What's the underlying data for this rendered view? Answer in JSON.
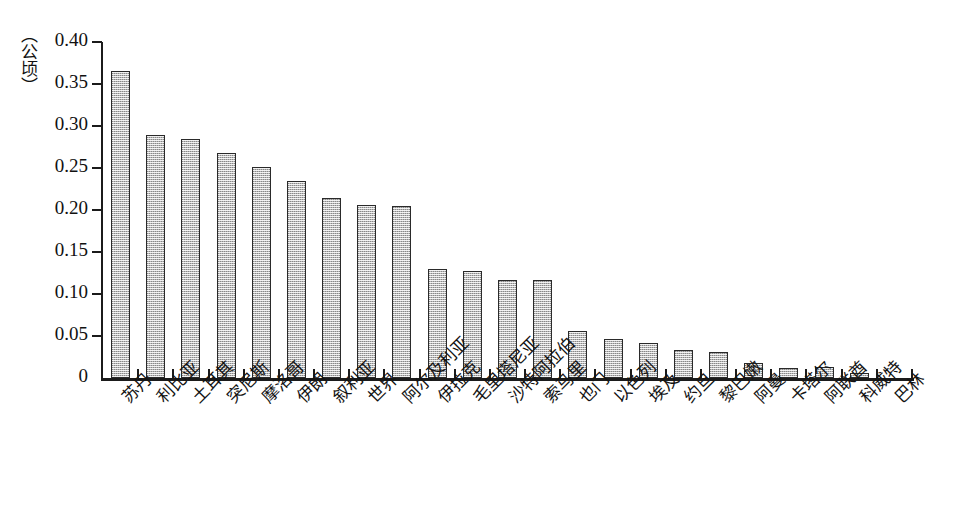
{
  "chart_data": {
    "type": "bar",
    "title": "",
    "subtitle": "",
    "xlabel": "",
    "ylabel": "（公顷）",
    "ylim": [
      0,
      0.4
    ],
    "ytick_labels": [
      "0.40",
      "0.35",
      "0.30",
      "0.25",
      "0.20",
      "0.15",
      "0.10",
      "0.05",
      "0"
    ],
    "ytick_values": [
      0.4,
      0.35,
      0.3,
      0.25,
      0.2,
      0.15,
      0.1,
      0.05,
      0
    ],
    "grid": false,
    "legend": null,
    "legend_position": "none",
    "categories": [
      "苏丹",
      "利比亚",
      "土耳其",
      "突尼斯",
      "摩洛哥",
      "伊朗",
      "叙利亚",
      "世界",
      "阿尔及利亚",
      "伊拉克",
      "毛里塔尼亚",
      "沙特阿拉伯",
      "索马里",
      "也门",
      "以色列",
      "埃及",
      "约旦",
      "黎巴嫩",
      "阿曼",
      "卡塔尔",
      "阿联酋",
      "科威特",
      "巴林"
    ],
    "values": [
      0.365,
      0.289,
      0.284,
      0.268,
      0.251,
      0.235,
      0.214,
      0.206,
      0.205,
      0.13,
      0.127,
      0.117,
      0.117,
      0.056,
      0.046,
      0.042,
      0.033,
      0.031,
      0.018,
      0.012,
      0.013,
      0.006,
      0.0
    ],
    "bar_color": "#b9b9b9",
    "bar_edge_color": "#2a2a2a",
    "axis_color": "#1b1b1b"
  }
}
